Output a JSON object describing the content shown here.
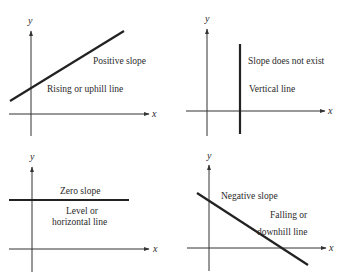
{
  "panels": [
    {
      "id": "positive",
      "axis_x_label": "x",
      "axis_y_label": "y",
      "labels": [
        "Positive slope",
        "Rising or uphill line"
      ]
    },
    {
      "id": "undefined",
      "axis_x_label": "x",
      "axis_y_label": "y",
      "labels": [
        "Slope does not exist",
        "Vertical line"
      ]
    },
    {
      "id": "zero",
      "axis_x_label": "x",
      "axis_y_label": "y",
      "labels": [
        "Zero slope",
        "Level or",
        "horizontal line"
      ]
    },
    {
      "id": "negative",
      "axis_x_label": "x",
      "axis_y_label": "y",
      "labels": [
        "Negative slope",
        "Falling or",
        "downhill line"
      ]
    }
  ],
  "colors": {
    "line": "#222222",
    "axis": "#333333",
    "text": "#2a2a2a",
    "background": "#ffffff"
  }
}
